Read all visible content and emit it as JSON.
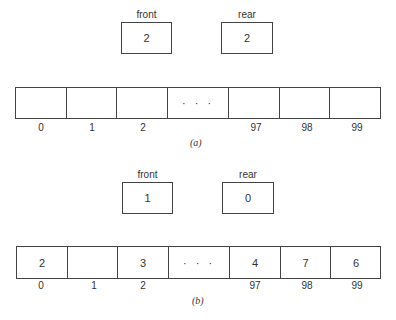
{
  "diagrams": [
    {
      "caption": "(a)",
      "front": {
        "label": "front",
        "value": "2"
      },
      "rear": {
        "label": "rear",
        "value": "2"
      },
      "cells": [
        "",
        "",
        "",
        "· · ·",
        "",
        "",
        ""
      ],
      "indices": [
        "0",
        "1",
        "2",
        "",
        "97",
        "98",
        "99"
      ]
    },
    {
      "caption": "(b)",
      "front": {
        "label": "front",
        "value": "1"
      },
      "rear": {
        "label": "rear",
        "value": "0"
      },
      "cells": [
        "2",
        "",
        "3",
        "· · ·",
        "4",
        "7",
        "6"
      ],
      "indices": [
        "0",
        "1",
        "2",
        "",
        "97",
        "98",
        "99"
      ]
    }
  ]
}
